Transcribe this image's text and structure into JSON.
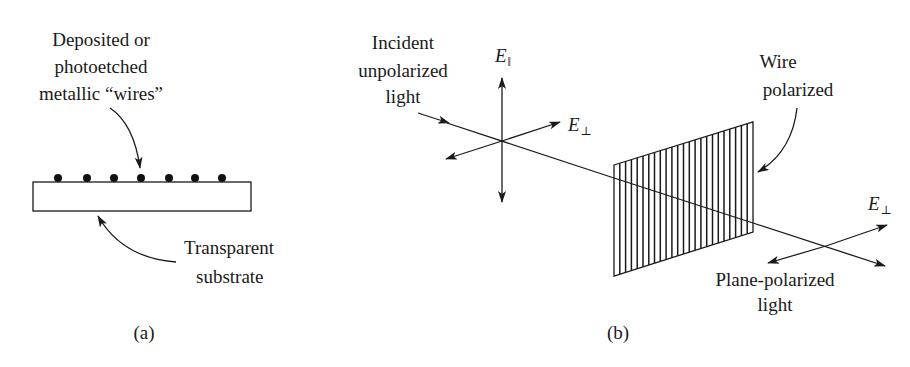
{
  "figure": {
    "panel_a": {
      "caption": "(a)",
      "label_wires": [
        "Deposited or",
        "photoetched",
        "metallic “wires”"
      ],
      "label_substrate": [
        "Transparent",
        "substrate"
      ],
      "wire_count": 7
    },
    "panel_b": {
      "caption": "(b)",
      "label_incident": [
        "Incident",
        "unpolarized",
        "light"
      ],
      "label_polarizer": [
        "Wire",
        "polarized"
      ],
      "label_output": [
        "Plane-polarized",
        "light"
      ],
      "field_parallel": {
        "symbol": "E",
        "subscript": "‖"
      },
      "field_perp_in": {
        "symbol": "E",
        "subscript": "⊥"
      },
      "field_perp_out": {
        "symbol": "E",
        "subscript": "⊥"
      },
      "polarizer_wire_count": 24
    }
  }
}
